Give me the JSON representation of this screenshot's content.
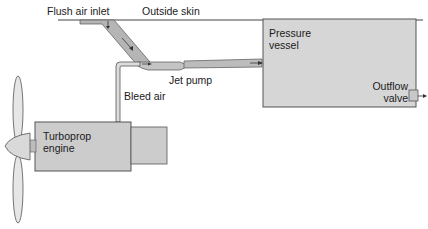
{
  "diagram": {
    "labels": {
      "flush_air_inlet": "Flush air inlet",
      "outside_skin": "Outside skin",
      "pressure_vessel_line1": "Pressure",
      "pressure_vessel_line2": "vessel",
      "jet_pump": "Jet pump",
      "bleed_air": "Bleed air",
      "outflow_valve_line1": "Outflow",
      "outflow_valve_line2": "valve",
      "turboprop_line1": "Turboprop",
      "turboprop_line2": "engine"
    },
    "colors": {
      "box_fill": "#d4d4d4",
      "box_stroke": "#555555",
      "duct_fill": "#b8b8b8",
      "line": "#333333"
    }
  }
}
